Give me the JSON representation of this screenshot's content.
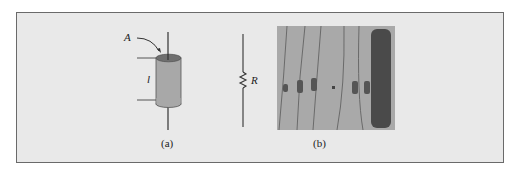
{
  "figure": {
    "panel_a": {
      "caption": "(a)",
      "area_label": "A",
      "length_label": "l",
      "resistor_label": "R"
    },
    "panel_b": {
      "caption": "(b)"
    },
    "colors": {
      "background": "#e9e9e9",
      "border": "#6a6a6a",
      "cylinder_body": "#a8a8a8",
      "cylinder_top": "#6f6f6f",
      "photo_bg": "#a9a9a9",
      "power_resistor": "#4a4a4a"
    }
  }
}
